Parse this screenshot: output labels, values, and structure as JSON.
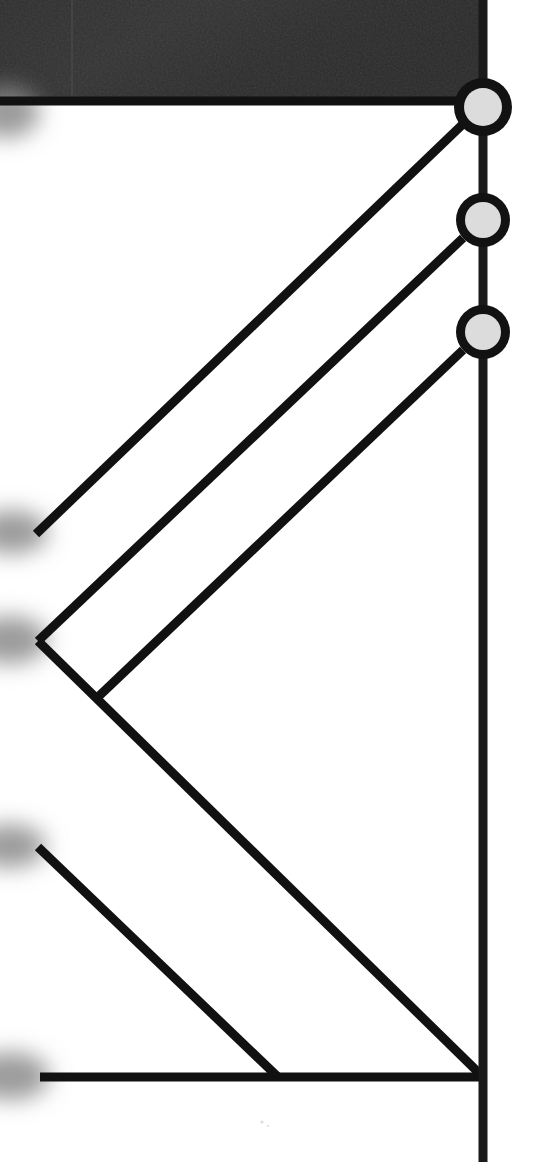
{
  "scene": {
    "title": "Structural truss joint detail",
    "width": 545,
    "height": 1162,
    "background_color": "#ffffff",
    "description": "Zoomed-in monochrome engineering line drawing showing a vertical chord member with three ringed pin joints and diagonal web members converging to a bottom chord."
  },
  "colors": {
    "line": "#111111",
    "line_dark": "#1a1a1a",
    "node_ring": "#121212",
    "node_fill": "#dcdcdc",
    "header_fill": "#2b2b2b",
    "header_fill_light": "#343434",
    "header_edge": "#0a0a0a",
    "background": "#ffffff",
    "blur_edge": "#8a8a8a"
  },
  "header_block": {
    "name": "dark-textured-block",
    "x": 0,
    "y": 0,
    "width": 483,
    "height": 100,
    "edge_thickness": 7,
    "label": "Dark textured plate region"
  },
  "vertical_member": {
    "name": "vertical-chord",
    "x": 483,
    "y_top": 0,
    "y_bottom": 1162,
    "thickness": 9,
    "label": "Vertical chord member"
  },
  "nodes": [
    {
      "id": "joint-1",
      "label": "Upper pin joint",
      "cx": 483,
      "cy": 107,
      "outer_r": 29,
      "inner_r": 19,
      "ring_width": 10
    },
    {
      "id": "joint-2",
      "label": "Middle pin joint",
      "cx": 483,
      "cy": 220,
      "outer_r": 27,
      "inner_r": 18,
      "ring_width": 9
    },
    {
      "id": "joint-3",
      "label": "Lower pin joint",
      "cx": 483,
      "cy": 332,
      "outer_r": 27,
      "inner_r": 18,
      "ring_width": 9
    }
  ],
  "members": [
    {
      "id": "member-top-chord",
      "label": "Top chord under plate",
      "x1": 0,
      "y1": 101,
      "x2": 466,
      "y2": 101,
      "thickness": 9
    },
    {
      "id": "member-diag-1",
      "label": "Web diagonal from upper joint",
      "x1": 463,
      "y1": 124,
      "x2": 36,
      "y2": 534,
      "thickness": 9
    },
    {
      "id": "member-diag-2",
      "label": "Web diagonal from middle joint",
      "x1": 463,
      "y1": 238,
      "x2": 38,
      "y2": 641,
      "thickness": 9
    },
    {
      "id": "member-diag-3",
      "label": "Web diagonal from lower joint",
      "x1": 463,
      "y1": 350,
      "x2": 98,
      "y2": 697,
      "thickness": 9
    },
    {
      "id": "member-diag-4",
      "label": "Long web diagonal to bottom joint",
      "x1": 38,
      "y1": 641,
      "x2": 483,
      "y2": 1077,
      "thickness": 9
    },
    {
      "id": "member-diag-5",
      "label": "Short web diagonal to bottom chord",
      "x1": 38,
      "y1": 847,
      "x2": 278,
      "y2": 1077,
      "thickness": 9
    },
    {
      "id": "member-bottom-chord",
      "label": "Bottom chord",
      "x1": 40,
      "y1": 1077,
      "x2": 483,
      "y2": 1077,
      "thickness": 9
    }
  ],
  "junctions": [
    {
      "id": "junction-left-mid",
      "label": "Left middle junction",
      "x": 38,
      "y": 641
    },
    {
      "id": "junction-inner",
      "label": "Inner web junction",
      "x": 98,
      "y": 697
    },
    {
      "id": "junction-left-low",
      "label": "Left lower junction",
      "x": 38,
      "y": 847
    },
    {
      "id": "junction-bottom-mid",
      "label": "Bottom chord junction",
      "x": 278,
      "y": 1077
    },
    {
      "id": "junction-bottom-right",
      "label": "Bottom right joint",
      "x": 483,
      "y": 1077
    }
  ],
  "blur_edges": [
    {
      "id": "blur-top-left",
      "label": "Soft left edge near plate",
      "cx": 6,
      "cy": 112,
      "rx": 34,
      "ry": 26
    },
    {
      "id": "blur-diag-1-end",
      "label": "Soft end of upper diagonal",
      "cx": 12,
      "cy": 532,
      "rx": 36,
      "ry": 22
    },
    {
      "id": "blur-diag-2-end",
      "label": "Soft end of middle diagonal",
      "cx": 10,
      "cy": 640,
      "rx": 38,
      "ry": 24
    },
    {
      "id": "blur-diag-5-end",
      "label": "Soft end of lower diagonal",
      "cx": 10,
      "cy": 846,
      "rx": 36,
      "ry": 22
    },
    {
      "id": "blur-bottom-chord-end",
      "label": "Soft end of bottom chord",
      "cx": 10,
      "cy": 1076,
      "rx": 40,
      "ry": 24
    }
  ]
}
